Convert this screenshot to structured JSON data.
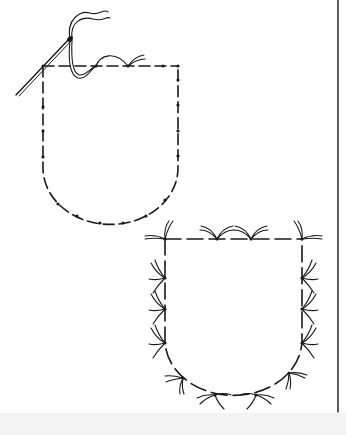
{
  "figure": {
    "caption_fragment": "",
    "stroke_color": "#1a1a1a",
    "background": "#ffffff",
    "footer_band_color": "#f3f3f3"
  },
  "pocket_a": {
    "label": "pocket being basted with needle and thread",
    "left": 43,
    "right": 178,
    "top": 66,
    "bottom": 224
  },
  "pocket_b": {
    "label": "pocket outline with tailor's tack loops",
    "left": 165,
    "right": 302,
    "top": 239,
    "bottom": 393
  }
}
